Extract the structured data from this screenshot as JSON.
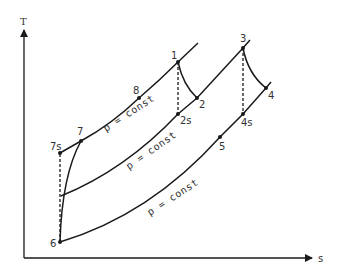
{
  "diagram": {
    "type": "T-s diagram",
    "axes": {
      "y_label": "T",
      "x_label": "s"
    },
    "points": [
      {
        "id": "1",
        "label": "1",
        "x": 178,
        "y": 62
      },
      {
        "id": "2",
        "label": "2",
        "x": 197,
        "y": 98
      },
      {
        "id": "2s",
        "label": "2s",
        "x": 178,
        "y": 114
      },
      {
        "id": "3",
        "label": "3",
        "x": 243,
        "y": 48
      },
      {
        "id": "4",
        "label": "4",
        "x": 266,
        "y": 88
      },
      {
        "id": "4s",
        "label": "4s",
        "x": 243,
        "y": 114
      },
      {
        "id": "5",
        "label": "5",
        "x": 220,
        "y": 137
      },
      {
        "id": "6",
        "label": "6",
        "x": 60,
        "y": 242
      },
      {
        "id": "7",
        "label": "7",
        "x": 81,
        "y": 141
      },
      {
        "id": "7s",
        "label": "7s",
        "x": 60,
        "y": 153
      },
      {
        "id": "8",
        "label": "8",
        "x": 139,
        "y": 98
      }
    ],
    "isobar_labels": {
      "top": "p = const",
      "middle": "p = const",
      "bottom": "p = const"
    },
    "colors": {
      "line": "#1a1a1a",
      "text": "#333333",
      "background": "#ffffff"
    }
  }
}
